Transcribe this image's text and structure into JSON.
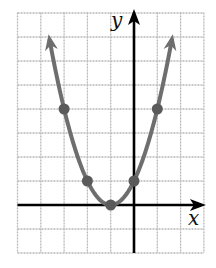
{
  "chart_data": {
    "type": "line",
    "title": "",
    "function": "y = (x + 1)^2",
    "xlabel": "x",
    "ylabel": "y",
    "xlim": [
      -5,
      3
    ],
    "ylim": [
      -2,
      8
    ],
    "grid": true,
    "grid_step": 1,
    "arrows_on_curve_ends": true,
    "points": [
      {
        "x": -3,
        "y": 4
      },
      {
        "x": -2,
        "y": 1
      },
      {
        "x": -1,
        "y": 0
      },
      {
        "x": 0,
        "y": 1
      },
      {
        "x": 1,
        "y": 4
      }
    ],
    "series": [
      {
        "name": "parabola",
        "x": [
          -4.1,
          -3,
          -2,
          -1,
          0,
          1,
          2.1
        ],
        "values": [
          9.6,
          4,
          1,
          0,
          1,
          4,
          9.6
        ]
      }
    ]
  },
  "colors": {
    "grid": "#b8b8b8",
    "axis": "#000000",
    "curve": "#6e6e6e",
    "point": "#5a5a5a"
  }
}
